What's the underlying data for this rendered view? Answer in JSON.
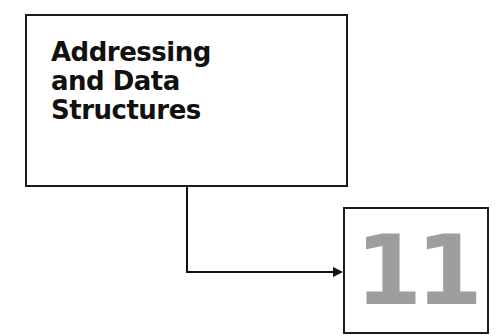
{
  "chapter": {
    "title_lines": [
      "Addressing",
      "and Data",
      "Structures"
    ],
    "number": "11",
    "number_color": "#9e9e9e"
  }
}
